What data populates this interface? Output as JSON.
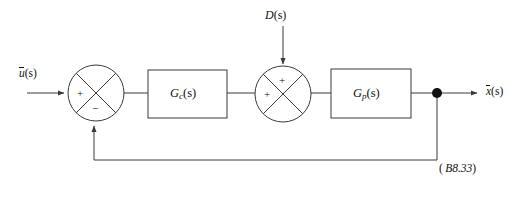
{
  "figure": {
    "type": "control-system-block-diagram",
    "background_color": "#ffffff",
    "line_color": "#3a3a3a",
    "text_color": "#111111"
  },
  "signals": {
    "input": {
      "symbol": "u",
      "overbar": true,
      "arg": "(s)",
      "full": "ū(s)"
    },
    "output": {
      "symbol": "x",
      "overbar": true,
      "arg": "(s)",
      "full": "x̄(s)"
    },
    "disturbance": {
      "symbol": "D",
      "arg": "(s)",
      "full": "D(s)"
    }
  },
  "blocks": [
    {
      "id": "controller",
      "symbol": "G",
      "subscript": "c",
      "arg": "(s)",
      "full": "G_c(s)"
    },
    {
      "id": "plant",
      "symbol": "G",
      "subscript": "p",
      "arg": "(s)",
      "full": "G_p(s)"
    }
  ],
  "summing_junctions": [
    {
      "id": "error-junction",
      "signs": {
        "west": "+",
        "south": "−"
      }
    },
    {
      "id": "disturbance-junction",
      "signs": {
        "west": "+",
        "north": "+"
      }
    }
  ],
  "nodes": {
    "takeoff": {
      "id": "feedback-takeoff-node",
      "filled": true
    }
  },
  "equation_tag": {
    "open": "(",
    "number": "B8.33",
    "close": ")",
    "full": "( B8.33)"
  }
}
